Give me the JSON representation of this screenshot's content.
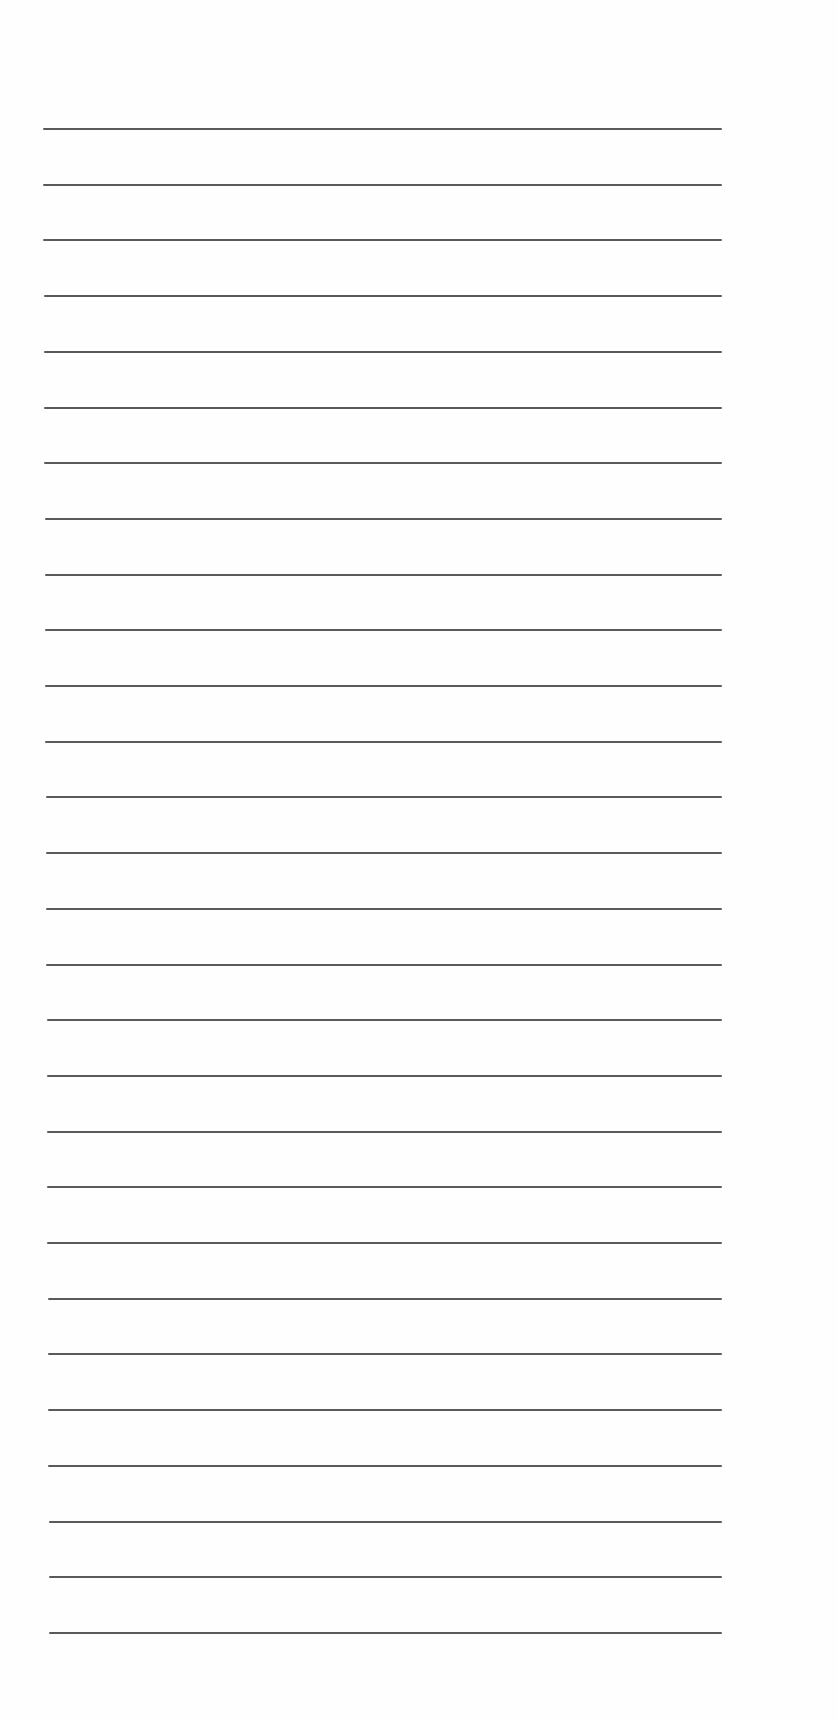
{
  "page": {
    "type": "lined-paper",
    "background_color": "#fefefe",
    "line_color": "#5a5a5a",
    "line_count": 28,
    "line_thickness_px": 2,
    "first_line_y": 128,
    "line_spacing_px": 55.7,
    "line_start_x": 43,
    "line_end_x": 722,
    "lines": [
      {
        "index": 1,
        "text": ""
      },
      {
        "index": 2,
        "text": ""
      },
      {
        "index": 3,
        "text": ""
      },
      {
        "index": 4,
        "text": ""
      },
      {
        "index": 5,
        "text": ""
      },
      {
        "index": 6,
        "text": ""
      },
      {
        "index": 7,
        "text": ""
      },
      {
        "index": 8,
        "text": ""
      },
      {
        "index": 9,
        "text": ""
      },
      {
        "index": 10,
        "text": ""
      },
      {
        "index": 11,
        "text": ""
      },
      {
        "index": 12,
        "text": ""
      },
      {
        "index": 13,
        "text": ""
      },
      {
        "index": 14,
        "text": ""
      },
      {
        "index": 15,
        "text": ""
      },
      {
        "index": 16,
        "text": ""
      },
      {
        "index": 17,
        "text": ""
      },
      {
        "index": 18,
        "text": ""
      },
      {
        "index": 19,
        "text": ""
      },
      {
        "index": 20,
        "text": ""
      },
      {
        "index": 21,
        "text": ""
      },
      {
        "index": 22,
        "text": ""
      },
      {
        "index": 23,
        "text": ""
      },
      {
        "index": 24,
        "text": ""
      },
      {
        "index": 25,
        "text": ""
      },
      {
        "index": 26,
        "text": ""
      },
      {
        "index": 27,
        "text": ""
      },
      {
        "index": 28,
        "text": ""
      }
    ]
  }
}
